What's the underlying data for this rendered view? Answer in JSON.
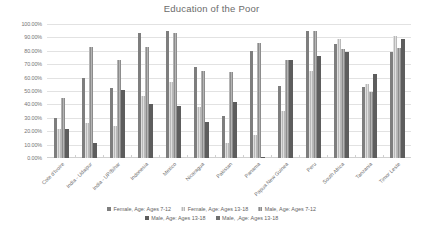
{
  "chart_data": {
    "type": "bar",
    "title": "Education of the Poor",
    "xlabel": "",
    "ylabel": "",
    "ylim": [
      0,
      1.0
    ],
    "grid": true,
    "legend_position": "bottom",
    "ytick_labels": [
      "100.00%",
      "90.00%",
      "80.00%",
      "70.00%",
      "60.00%",
      "50.00%",
      "40.00%",
      "30.00%",
      "20.00%",
      "10.00%",
      "0.00%"
    ],
    "ytick_values": [
      100,
      90,
      80,
      70,
      60,
      50,
      40,
      30,
      20,
      10,
      0
    ],
    "categories": [
      "Cote d'Ivoire",
      "India - Udaipur",
      "India - UP/Bihar",
      "Indonesia",
      "Mexico",
      "Nicaragua",
      "Pakistan",
      "Panama",
      "Papua New Guinea",
      "Peru",
      "South Africa",
      "Tanzania",
      "Timor Leste"
    ],
    "series": [
      {
        "name": "Female, Age: Ages 7-12",
        "color": "#7e7e7e",
        "values": [
          30,
          60,
          52,
          93,
          95,
          68,
          31,
          80,
          54,
          95,
          85,
          53,
          79
        ]
      },
      {
        "name": "Female, Age: Ages 13-18",
        "color": "#b9b9b9",
        "values": [
          22,
          26,
          24,
          46,
          57,
          38,
          11,
          17,
          35,
          65,
          89,
          55,
          91
        ]
      },
      {
        "name": "Male, Age: Ages 7-12",
        "color": "#8c8c8c",
        "values": [
          45,
          83,
          73,
          83,
          93,
          65,
          64,
          86,
          73,
          95,
          81,
          49,
          82
        ]
      },
      {
        "name": "Male, Age: Ages 13-18",
        "color": "#5d5d5d",
        "values": [
          22,
          11,
          51,
          40,
          39,
          27,
          42,
          1,
          73,
          76,
          79,
          63,
          89
        ]
      },
      {
        "name": "Male, ,Age: Ages 13-18",
        "color": "#6f6f6f",
        "values": [
          0,
          0,
          0,
          0,
          0,
          0,
          0,
          0,
          0,
          0,
          0,
          0,
          0
        ]
      }
    ]
  },
  "legend": {
    "rows": [
      [
        {
          "label": "Female, Age: Ages 7-12",
          "series": 0
        },
        {
          "label": "Female, Age: Ages 13-18",
          "series": 1
        },
        {
          "label": "Male, Age: Ages 7-12",
          "series": 2
        }
      ],
      [
        {
          "label": "Male, Age: Ages 13-18",
          "series": 3
        },
        {
          "label": "Male, ,Age: Ages 13-18",
          "series": 4
        }
      ]
    ]
  }
}
